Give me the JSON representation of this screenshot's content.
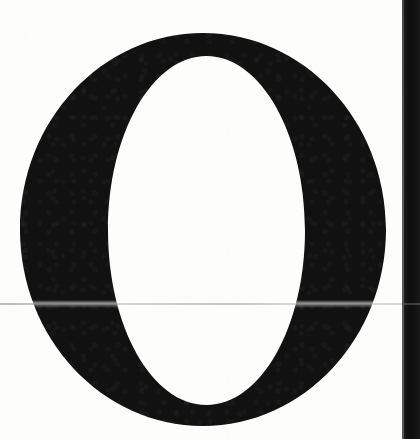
{
  "document": {
    "type": "scanned-page-fragment",
    "content_kind": "typographic-drop-cap",
    "caption": "Scanned page fragment showing a large serif capital letter O"
  },
  "letterform": {
    "glyph": "O",
    "glyph_name": "latin-capital-letter-o",
    "style": "serif-didone-high-contrast",
    "ink_color": "#111111",
    "bounds": {
      "left": 20,
      "top": 33,
      "right": 386,
      "bottom": 426
    },
    "counter_bounds": {
      "left": 108,
      "top": 56,
      "right": 305,
      "bottom": 405
    },
    "stroke_thin_px": 22,
    "stroke_thick_px": 88
  },
  "page": {
    "background_color": "#fdfdfc",
    "width": 420,
    "height": 439
  },
  "artifacts": {
    "fold_line": {
      "name": "horizontal-fold-line",
      "y": 303,
      "color": "#8a8a8c"
    },
    "gutter_band": {
      "name": "right-edge-dark-band",
      "x": 404,
      "width": 16,
      "color": "#121213"
    }
  }
}
